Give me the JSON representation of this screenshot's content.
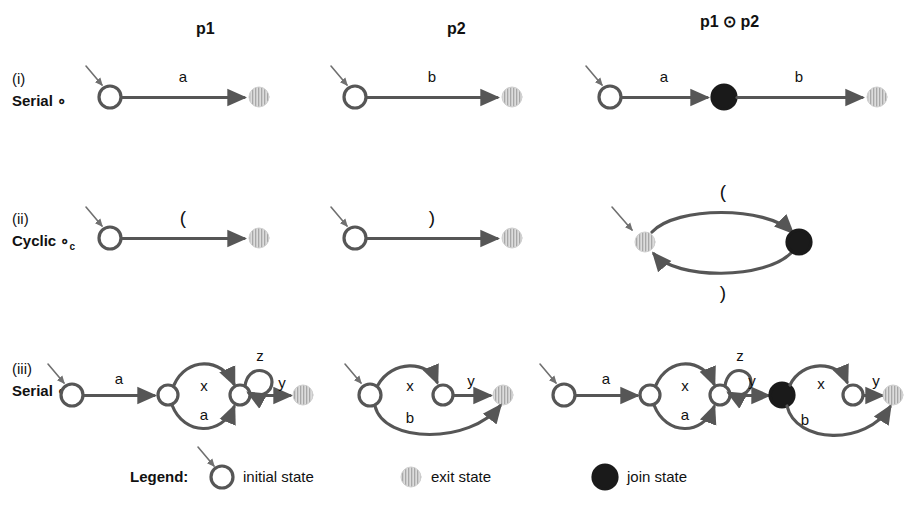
{
  "figure": {
    "background": "#ffffff",
    "stroke_color": "#565656",
    "text_color": "#111111",
    "exit_state_color": "#c9c9c9",
    "join_state_color": "#1a1a1a",
    "initial_state_color": "#565656"
  },
  "columns": [
    {
      "id": "p1",
      "label": "p1"
    },
    {
      "id": "p2",
      "label": "p2"
    },
    {
      "id": "composed",
      "label": "p1 ⊙ p2"
    }
  ],
  "rows": [
    {
      "id": "i",
      "roman": "(i)",
      "kind": "Serial",
      "operator": "∘",
      "subscript": ""
    },
    {
      "id": "ii",
      "roman": "(ii)",
      "kind": "Cyclic",
      "operator": "∘",
      "subscript": "c"
    },
    {
      "id": "iii",
      "roman": "(iii)",
      "kind": "Serial",
      "operator": "∘",
      "subscript": ""
    }
  ],
  "edge_labels": {
    "row_i": {
      "p1": [
        "a"
      ],
      "p2": [
        "b"
      ],
      "composed": [
        "a",
        "b"
      ]
    },
    "row_ii": {
      "p1": [
        "("
      ],
      "p2": [
        ")"
      ],
      "composed": [
        "(",
        ")"
      ]
    },
    "row_iii": {
      "p1": [
        "a",
        "x",
        "a",
        "z",
        "y"
      ],
      "p2": [
        "x",
        "b",
        "y"
      ],
      "composed": [
        "a",
        "x",
        "a",
        "z",
        "y",
        "x",
        "b",
        "y"
      ]
    }
  },
  "legend": {
    "title": "Legend:",
    "items": [
      {
        "icon": "initial-state-icon",
        "label": "initial state"
      },
      {
        "icon": "exit-state-icon",
        "label": "exit state"
      },
      {
        "icon": "join-state-icon",
        "label": "join state"
      }
    ]
  }
}
